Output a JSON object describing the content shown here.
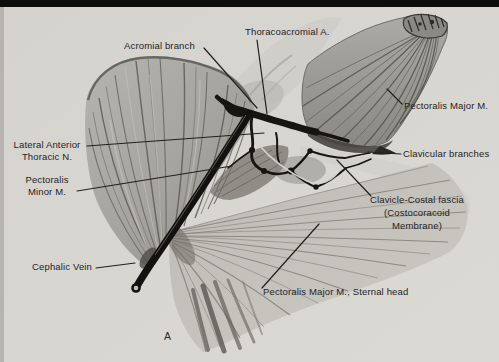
{
  "figure": {
    "caption": "A",
    "labels": {
      "acromial_branch": "Acromial branch",
      "thoracoacromial": "Thoracoacromial A.",
      "pectoralis_major": "Pectoralis Major M.",
      "lateral_anterior_thoracic": "Lateral Anterior\nThoracic N.",
      "clavicular_branches": "Clavicular branches",
      "pectoralis_minor": "Pectoralis\nMinor M.",
      "clavicle_costal_fascia": "Clavicle-Costal fascia\n(Costocoracoid\nMembrane)",
      "cephalic_vein": "Cephalic Vein",
      "pectoralis_major_sternal": "Pectoralis Major M., Sternal head"
    },
    "colors": {
      "paper": "#d7d5d0",
      "ink": "#17150f",
      "muscle_mid": "#a3a19b",
      "muscle_dark": "#57554f",
      "muscle_light": "#cdcbc5"
    }
  }
}
